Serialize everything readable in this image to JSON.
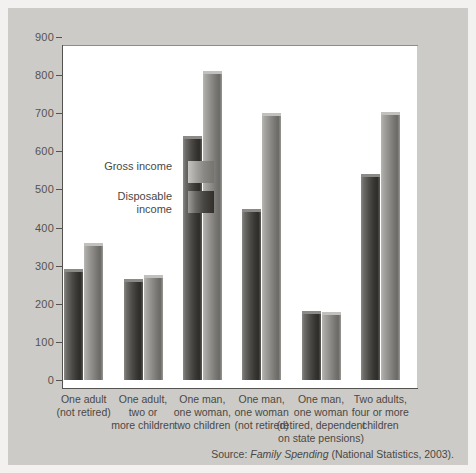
{
  "chart_data": {
    "type": "bar",
    "title": "",
    "xlabel": "",
    "ylabel": "",
    "ylim": [
      0,
      900
    ],
    "yticks": [
      0,
      100,
      200,
      300,
      400,
      500,
      600,
      700,
      800,
      900
    ],
    "grid": false,
    "legend_position": "inside-upper-left",
    "categories": [
      "One adult\n(not retired)",
      "One adult,\ntwo or\nmore children",
      "One man,\none woman,\ntwo children",
      "One man,\none woman\n(not retired)",
      "One man,\none woman\n(retired, dependent\non state pensions)",
      "Two adults,\nfour or more\nchildren"
    ],
    "category_lines": [
      [
        "One adult",
        "(not retired)"
      ],
      [
        "One adult,",
        "two or",
        "more children"
      ],
      [
        "One man,",
        "one woman,",
        "two children"
      ],
      [
        "One man,",
        "one woman",
        "(not retired)"
      ],
      [
        "One man,",
        "one woman",
        "(retired, dependent",
        "on state pensions)"
      ],
      [
        "Two adults,",
        "four or more",
        "children"
      ]
    ],
    "series": [
      {
        "name": "Disposable income",
        "color": "#4e4c48",
        "values": [
          292,
          265,
          641,
          450,
          182,
          541
        ]
      },
      {
        "name": "Gross income",
        "color": "#8e8c88",
        "values": [
          360,
          275,
          811,
          701,
          179,
          703
        ]
      }
    ],
    "bar_order_in_group": [
      "Disposable income",
      "Gross income"
    ]
  },
  "legend": {
    "items": [
      {
        "label_lines": [
          "Gross income"
        ],
        "swatch": "gross"
      },
      {
        "label_lines": [
          "Disposable",
          "income"
        ],
        "swatch": "disposable"
      }
    ]
  },
  "axis": {
    "y_tick_labels": [
      "900",
      "800",
      "700",
      "600",
      "500",
      "400",
      "300",
      "200",
      "100",
      "0"
    ]
  },
  "source": {
    "prefix": "Source: ",
    "italic": "Family Spending",
    "suffix": " (National Statistics, 2003)."
  },
  "colors": {
    "panel_background": "#cdcbc7",
    "plot_background": "#ffffff",
    "axis": "#55534f",
    "text": "#4a4844",
    "gross_bar": "#8e8c88",
    "disposable_bar": "#4e4c48"
  }
}
